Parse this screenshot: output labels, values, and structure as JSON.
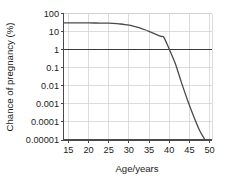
{
  "chart_data": {
    "type": "line",
    "title": "",
    "subtitle": "",
    "xlabel": "Age/years",
    "ylabel": "Chance of pregnancy (%)",
    "xscale": "linear",
    "yscale": "log",
    "xlim": [
      13.8,
      50.6
    ],
    "ylim": [
      1e-05,
      100
    ],
    "grid": true,
    "legend": null,
    "legend_position": "none",
    "xticks": [
      15,
      20,
      25,
      30,
      35,
      40,
      45,
      50
    ],
    "xticklabels": [
      "15",
      "20",
      "25",
      "30",
      "35",
      "40",
      "45",
      "50"
    ],
    "yticks": [
      100,
      10,
      1,
      0.1,
      0.01,
      0.001,
      0.0001,
      1e-05
    ],
    "yticklabels": [
      "100",
      "10",
      "1",
      "0.1",
      "0.01",
      "0.001",
      "0.0001",
      "0.00001"
    ],
    "reference_line": {
      "y": 1,
      "emphasis": "dark",
      "color": "#3a3a3a"
    },
    "series": [
      {
        "name": "Chance of pregnancy",
        "color": "#4a4a4a",
        "linewidth": 1.3,
        "x": [
          14.0,
          16.0,
          18.0,
          20.0,
          22.0,
          24.0,
          25.0,
          26.0,
          27.0,
          28.0,
          29.0,
          30.0,
          31.0,
          32.0,
          33.0,
          34.0,
          35.0,
          36.0,
          37.0,
          38.0,
          38.6,
          39.4,
          40.2,
          41.5,
          43.0,
          44.5,
          46.0,
          47.5,
          48.7
        ],
        "y": [
          30.0,
          30.0,
          30.0,
          30.0,
          29.8,
          29.4,
          29.0,
          28.4,
          27.5,
          26.2,
          24.5,
          22.5,
          20.2,
          17.8,
          15.2,
          12.6,
          10.2,
          8.2,
          6.6,
          5.4,
          5.0,
          2.2,
          0.85,
          0.17,
          0.016,
          0.0017,
          0.00022,
          3.5e-05,
          1.2e-05
        ]
      }
    ],
    "colors": {
      "grid": "#c9ced6",
      "axis": "#4a4a4a",
      "curve": "#4a4a4a",
      "text": "#1b1b1b",
      "background": "#ffffff"
    }
  },
  "axes": {
    "ylabel": "Chance of pregnancy (%)",
    "xlabel": "Age/years"
  },
  "yticklabels": {
    "0": "100",
    "1": "10",
    "2": "1",
    "3": "0.1",
    "4": "0.01",
    "5": "0.001",
    "6": "0.0001",
    "7": "0.00001"
  },
  "xticklabels": {
    "0": "15",
    "1": "20",
    "2": "25",
    "3": "30",
    "4": "35",
    "5": "40",
    "6": "45",
    "7": "50"
  }
}
